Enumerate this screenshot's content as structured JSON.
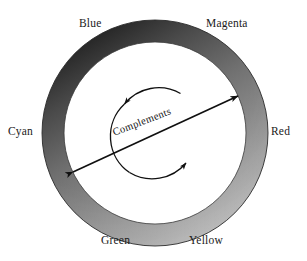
{
  "figure": {
    "background_color": "#ffffff",
    "ring": {
      "center_x": 155,
      "center_y": 133,
      "outer_radius": 113,
      "inner_radius": 91,
      "gradient_dark": "#1d1d1d",
      "gradient_mid": "#8a8a8a",
      "gradient_light": "#c9c9c9",
      "outline_color": "#2a2a2a"
    },
    "wheel_labels": [
      {
        "id": "blue",
        "text": "Blue"
      },
      {
        "id": "magenta",
        "text": "Magenta"
      },
      {
        "id": "cyan",
        "text": "Cyan"
      },
      {
        "id": "red",
        "text": "Red"
      },
      {
        "id": "green",
        "text": "Green"
      },
      {
        "id": "yellow",
        "text": "Yellow"
      }
    ],
    "center_annotation": {
      "text": "Complements",
      "rotation_degrees": -21
    },
    "arrows": {
      "diagonal": {
        "name": "complements-axis-arrow",
        "double_headed": true,
        "start_label": "Cyan",
        "end_label": "Red",
        "color": "#101010"
      },
      "circular": {
        "name": "rotation-arc-arrow",
        "direction": "counterclockwise",
        "color": "#101010"
      }
    }
  }
}
